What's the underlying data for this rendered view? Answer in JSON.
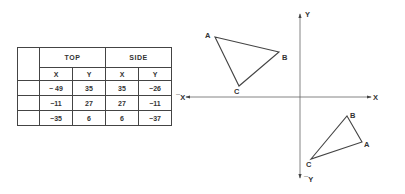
{
  "table": {
    "groups": [
      "TOP",
      "SIDE"
    ],
    "subheaders": [
      "X",
      "Y",
      "X",
      "Y"
    ],
    "rows": [
      {
        "label": "",
        "values": [
          "− 49",
          "35",
          "35",
          "−26"
        ]
      },
      {
        "label": "",
        "values": [
          "−11",
          "27",
          "27",
          "−11"
        ]
      },
      {
        "label": "",
        "values": [
          "−35",
          "6",
          "6",
          "−37"
        ]
      }
    ]
  },
  "axes": {
    "pos_x": "X",
    "neg_x": "¯X",
    "pos_y": "Y",
    "neg_y": "¯Y"
  },
  "triangles": {
    "top_view": {
      "A": {
        "label": "A",
        "px": [
          215,
          37
        ]
      },
      "B": {
        "label": "B",
        "px": [
          279,
          52
        ]
      },
      "C": {
        "label": "C",
        "px": [
          239,
          86
        ]
      }
    },
    "side_view": {
      "A": {
        "label": "A",
        "px": [
          362,
          142
        ]
      },
      "B": {
        "label": "B",
        "px": [
          347,
          116
        ]
      },
      "C": {
        "label": "C",
        "px": [
          311,
          159
        ]
      }
    }
  },
  "colors": {
    "line": "#444444",
    "background": "#ffffff"
  }
}
